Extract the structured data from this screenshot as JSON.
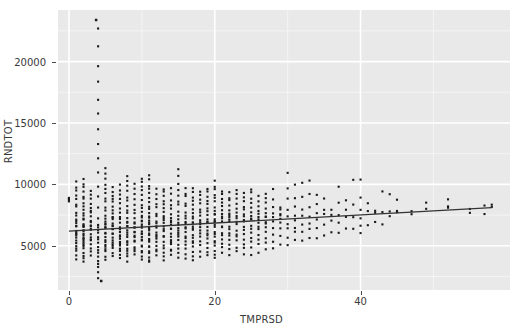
{
  "chart_data": {
    "type": "scatter",
    "title": "",
    "subtitle": "",
    "xlabel": "TMPRSD",
    "ylabel": "RNDTOT",
    "xlim": [
      -1.5,
      60.5
    ],
    "ylim": [
      1400,
      24200
    ],
    "x_ticks": [
      0,
      20,
      40
    ],
    "x_tick_labels": [
      "0",
      "20",
      "40"
    ],
    "y_ticks": [
      5000,
      10000,
      15000,
      20000
    ],
    "y_tick_labels": [
      "5000",
      "10000",
      "15000",
      "20000"
    ],
    "x_minor_ticks": [
      10,
      30,
      50
    ],
    "y_minor_ticks": [
      2500,
      7500,
      12500,
      17500,
      22500
    ],
    "grid": true,
    "grid_major_color": "#ffffff",
    "grid_minor_color": "#f4f4f4",
    "panel_background": "#e9e9e9",
    "point_color": "#1a1a1a",
    "point_size": 2.1,
    "legend": "none",
    "fit_line": {
      "name": "linear fit",
      "color": "#333333",
      "width": 1.3,
      "x_start": 0,
      "y_start": 6200,
      "x_end": 58,
      "y_end": 8100,
      "slope": 32.8,
      "intercept": 6200
    },
    "annotations": [
      {
        "label": "high outlier",
        "x": 3.7,
        "y": 23400
      },
      {
        "label": "low outlier",
        "x": 4.4,
        "y": 2150
      }
    ],
    "series": [
      {
        "name": "RNDTOT vs TMPRSD",
        "marker": "square",
        "columns": [
          {
            "x": 0,
            "n": 4,
            "ymin": 8500,
            "ymax": 8900,
            "mode": 8700
          },
          {
            "x": 1,
            "n": 26,
            "ymin": 3800,
            "ymax": 10400,
            "mode": 6600
          },
          {
            "x": 2,
            "n": 32,
            "ymin": 3650,
            "ymax": 10500,
            "mode": 6500
          },
          {
            "x": 3,
            "n": 22,
            "ymin": 4100,
            "ymax": 9700,
            "mode": 6700
          },
          {
            "x": 4,
            "n": 30,
            "ymin": 2150,
            "ymax": 23400,
            "mode": 6600
          },
          {
            "x": 5,
            "n": 28,
            "ymin": 3700,
            "ymax": 11600,
            "mode": 6800
          },
          {
            "x": 6,
            "n": 26,
            "ymin": 4000,
            "ymax": 9900,
            "mode": 6700
          },
          {
            "x": 7,
            "n": 24,
            "ymin": 3900,
            "ymax": 10200,
            "mode": 6400
          },
          {
            "x": 8,
            "n": 26,
            "ymin": 3500,
            "ymax": 10900,
            "mode": 6600
          },
          {
            "x": 9,
            "n": 22,
            "ymin": 4000,
            "ymax": 10200,
            "mode": 6500
          },
          {
            "x": 10,
            "n": 28,
            "ymin": 3700,
            "ymax": 10700,
            "mode": 6700
          },
          {
            "x": 11,
            "n": 30,
            "ymin": 3400,
            "ymax": 10900,
            "mode": 6600
          },
          {
            "x": 12,
            "n": 20,
            "ymin": 3900,
            "ymax": 9900,
            "mode": 6500
          },
          {
            "x": 13,
            "n": 22,
            "ymin": 3400,
            "ymax": 9900,
            "mode": 6800
          },
          {
            "x": 14,
            "n": 20,
            "ymin": 3900,
            "ymax": 9800,
            "mode": 6600
          },
          {
            "x": 15,
            "n": 22,
            "ymin": 3900,
            "ymax": 11400,
            "mode": 6900
          },
          {
            "x": 16,
            "n": 20,
            "ymin": 3700,
            "ymax": 10000,
            "mode": 6700
          },
          {
            "x": 17,
            "n": 22,
            "ymin": 3600,
            "ymax": 9900,
            "mode": 6800
          },
          {
            "x": 18,
            "n": 18,
            "ymin": 3900,
            "ymax": 9700,
            "mode": 6900
          },
          {
            "x": 19,
            "n": 20,
            "ymin": 3900,
            "ymax": 9900,
            "mode": 7000
          },
          {
            "x": 20,
            "n": 24,
            "ymin": 3700,
            "ymax": 10500,
            "mode": 7000
          },
          {
            "x": 21,
            "n": 18,
            "ymin": 4100,
            "ymax": 9700,
            "mode": 7100
          },
          {
            "x": 22,
            "n": 18,
            "ymin": 4000,
            "ymax": 9500,
            "mode": 7000
          },
          {
            "x": 23,
            "n": 16,
            "ymin": 4200,
            "ymax": 9800,
            "mode": 7100
          },
          {
            "x": 24,
            "n": 16,
            "ymin": 3900,
            "ymax": 9600,
            "mode": 7100
          },
          {
            "x": 25,
            "n": 16,
            "ymin": 4000,
            "ymax": 9900,
            "mode": 7200
          },
          {
            "x": 26,
            "n": 14,
            "ymin": 4200,
            "ymax": 9200,
            "mode": 7100
          },
          {
            "x": 27,
            "n": 14,
            "ymin": 4500,
            "ymax": 9500,
            "mode": 7200
          },
          {
            "x": 28,
            "n": 10,
            "ymin": 4300,
            "ymax": 9900,
            "mode": 7200
          },
          {
            "x": 29,
            "n": 9,
            "ymin": 4800,
            "ymax": 8400,
            "mode": 7200
          },
          {
            "x": 30,
            "n": 9,
            "ymin": 4700,
            "ymax": 11600,
            "mode": 7300
          },
          {
            "x": 31,
            "n": 8,
            "ymin": 5000,
            "ymax": 10400,
            "mode": 7300
          },
          {
            "x": 32,
            "n": 7,
            "ymin": 5000,
            "ymax": 10900,
            "mode": 7400
          },
          {
            "x": 33,
            "n": 7,
            "ymin": 5100,
            "ymax": 11000,
            "mode": 7400
          },
          {
            "x": 34,
            "n": 6,
            "ymin": 4900,
            "ymax": 9700,
            "mode": 7400
          },
          {
            "x": 35,
            "n": 5,
            "ymin": 5300,
            "ymax": 9300,
            "mode": 7500
          },
          {
            "x": 36,
            "n": 4,
            "ymin": 5400,
            "ymax": 8100,
            "mode": 7500
          },
          {
            "x": 37,
            "n": 5,
            "ymin": 5600,
            "ymax": 10600,
            "mode": 7500
          },
          {
            "x": 38,
            "n": 4,
            "ymin": 5800,
            "ymax": 9400,
            "mode": 7600
          },
          {
            "x": 39,
            "n": 4,
            "ymin": 5700,
            "ymax": 11700,
            "mode": 7600
          },
          {
            "x": 40,
            "n": 6,
            "ymin": 5500,
            "ymax": 11300,
            "mode": 7600
          },
          {
            "x": 41,
            "n": 3,
            "ymin": 6100,
            "ymax": 9100,
            "mode": 7700
          },
          {
            "x": 42,
            "n": 3,
            "ymin": 6200,
            "ymax": 8100,
            "mode": 7700
          },
          {
            "x": 43,
            "n": 3,
            "ymin": 6200,
            "ymax": 10600,
            "mode": 7700
          },
          {
            "x": 44,
            "n": 3,
            "ymin": 7200,
            "ymax": 10300,
            "mode": 7800
          },
          {
            "x": 45,
            "n": 3,
            "ymin": 7700,
            "ymax": 9600,
            "mode": 7800
          },
          {
            "x": 47,
            "n": 2,
            "ymin": 7200,
            "ymax": 7900,
            "mode": 7800
          },
          {
            "x": 49,
            "n": 2,
            "ymin": 8000,
            "ymax": 9000,
            "mode": 8000
          },
          {
            "x": 52,
            "n": 3,
            "ymin": 8100,
            "ymax": 9100,
            "mode": 8100
          },
          {
            "x": 55,
            "n": 2,
            "ymin": 7000,
            "ymax": 8100,
            "mode": 8000
          },
          {
            "x": 57,
            "n": 2,
            "ymin": 7000,
            "ymax": 8400,
            "mode": 8100
          },
          {
            "x": 58,
            "n": 2,
            "ymin": 8100,
            "ymax": 8400,
            "mode": 8200
          }
        ]
      }
    ]
  }
}
